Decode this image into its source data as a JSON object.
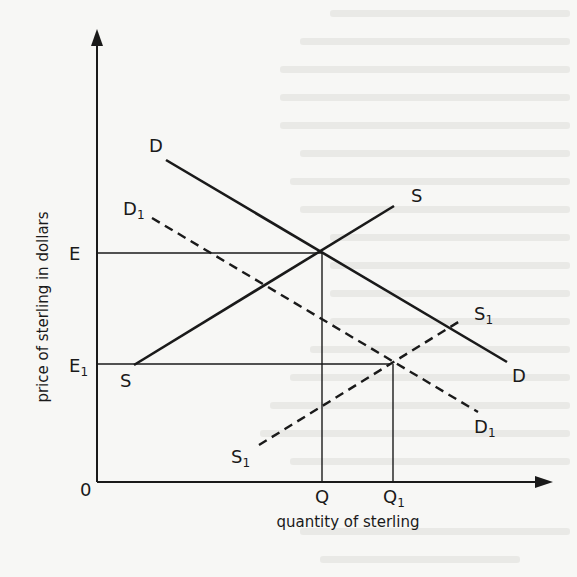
{
  "figure": {
    "type": "supply-demand diagram",
    "axes": {
      "x_label": "quantity of sterling",
      "y_label": "price of sterling in dollars",
      "origin_label": "0"
    },
    "price_levels": [
      {
        "id": "E",
        "label": "E",
        "sub": ""
      },
      {
        "id": "E1",
        "label": "E",
        "sub": "1"
      }
    ],
    "quantity_levels": [
      {
        "id": "Q",
        "label": "Q",
        "sub": ""
      },
      {
        "id": "Q1",
        "label": "Q",
        "sub": "1"
      }
    ],
    "curves": [
      {
        "id": "D",
        "label": "D",
        "sub": "",
        "style": "solid",
        "kind": "demand"
      },
      {
        "id": "D1",
        "label": "D",
        "sub": "1",
        "style": "dashed",
        "kind": "demand"
      },
      {
        "id": "S",
        "label": "S",
        "sub": "",
        "style": "solid",
        "kind": "supply"
      },
      {
        "id": "S1",
        "label": "S",
        "sub": "1",
        "style": "dashed",
        "kind": "supply"
      }
    ],
    "equilibria": [
      {
        "curves": [
          "D",
          "S"
        ],
        "price": "E",
        "quantity": "Q"
      },
      {
        "curves": [
          "D1",
          "S1"
        ],
        "price": "E1",
        "quantity": "Q1"
      }
    ],
    "colors": {
      "ink": "#1a1a1a",
      "paper": "#f7f7f5"
    }
  },
  "labels": {
    "origin": "0",
    "x_axis_title": "quantity of sterling",
    "y_axis_title": "price of sterling in dollars",
    "E": "E",
    "E1_main": "E",
    "E1_sub": "1",
    "Q": "Q",
    "Q1_main": "Q",
    "Q1_sub": "1",
    "D_top": "D",
    "D_bottom": "D",
    "D1_top_main": "D",
    "D1_top_sub": "1",
    "D1_bottom_main": "D",
    "D1_bottom_sub": "1",
    "S_top": "S",
    "S_bottom": "S",
    "S1_top_main": "S",
    "S1_top_sub": "1",
    "S1_bottom_main": "S",
    "S1_bottom_sub": "1"
  }
}
